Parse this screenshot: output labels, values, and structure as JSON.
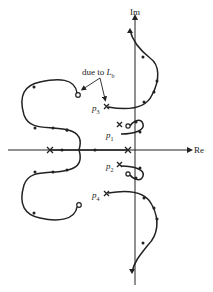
{
  "axes": {
    "real_label": "Re",
    "imag_label": "Im"
  },
  "annotation": {
    "text": "due to",
    "symbol": "L",
    "subscript": "b"
  },
  "poles": [
    {
      "label": "p",
      "sub": "1"
    },
    {
      "label": "p",
      "sub": "2"
    },
    {
      "label": "p",
      "sub": "3"
    },
    {
      "label": "p",
      "sub": "4"
    }
  ],
  "colors": {
    "line": "#222222",
    "background": "#ffffff"
  }
}
